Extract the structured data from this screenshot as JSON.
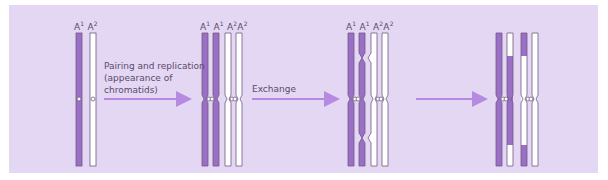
{
  "figure": {
    "background_color": "#e4d7f4",
    "dark_chromatid_color": "#9b6fc6",
    "light_chromatid_color": "#ffffff",
    "outline_color": "#6e5a80",
    "arrow_color": "#b58ae0"
  },
  "stages": [
    {
      "id": "stage-1",
      "labels": [
        {
          "base": "A",
          "sup": "1"
        },
        {
          "base": "A",
          "sup": "2"
        }
      ]
    },
    {
      "id": "stage-2",
      "labels": [
        {
          "base": "A",
          "sup": "1"
        },
        {
          "base": "A",
          "sup": "1"
        },
        {
          "base": "A",
          "sup": "2"
        },
        {
          "base": "A",
          "sup": "2"
        }
      ]
    },
    {
      "id": "stage-3",
      "labels": [
        {
          "base": "A",
          "sup": "1"
        },
        {
          "base": "A",
          "sup": "1"
        },
        {
          "base": "A",
          "sup": "2"
        },
        {
          "base": "A",
          "sup": "2"
        }
      ]
    },
    {
      "id": "stage-4",
      "labels": []
    }
  ],
  "arrows": [
    {
      "label_lines": [
        "Pairing and replication",
        "(appearance of",
        "chromatids)"
      ]
    },
    {
      "label_lines": [
        "Exchange"
      ]
    },
    {
      "label_lines": []
    }
  ]
}
